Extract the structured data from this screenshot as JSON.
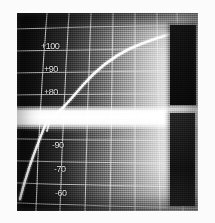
{
  "figure": {
    "kind": "oscillogram",
    "plate_background": "#0a0a0a",
    "trace_color": "#ffffff",
    "grid_color": "#e8e8e8",
    "page_background": "#fbfbfb"
  },
  "chart_data": {
    "type": "line",
    "title": "",
    "subtitle": "",
    "xlabel": "",
    "ylabel": "",
    "grid": true,
    "grid_style": "curvilinear graticule",
    "legend": "none",
    "ylim": [
      -100,
      110
    ],
    "xlim": [
      0,
      100
    ],
    "ytick_labels": [
      "+100",
      "+90",
      "+80",
      "-90",
      "-70",
      "-60",
      "-80"
    ],
    "ytick_values": [
      100,
      90,
      80,
      -90,
      -70,
      -60,
      -80
    ],
    "xtick_labels": [],
    "annotations": [],
    "series": [
      {
        "name": "upper-trace",
        "x": [
          20,
          24,
          28,
          33,
          38,
          45,
          52,
          60,
          68,
          76,
          84,
          90,
          95,
          100
        ],
        "y": [
          8,
          18,
          30,
          41,
          50,
          58,
          64,
          70,
          76,
          82,
          88,
          93,
          97,
          99
        ]
      },
      {
        "name": "baseline-band",
        "x": [
          0,
          100
        ],
        "y": [
          0,
          0
        ]
      },
      {
        "name": "lower-trace",
        "x": [
          1,
          2,
          3,
          4,
          6,
          8,
          11,
          14,
          17,
          19
        ],
        "y": [
          -6,
          -20,
          -36,
          -50,
          -64,
          -76,
          -86,
          -93,
          -97,
          -100
        ]
      }
    ]
  },
  "axis_labels": [
    {
      "text": "+100",
      "top": 28,
      "left": 24
    },
    {
      "text": "+90",
      "top": 51,
      "left": 27
    },
    {
      "text": "+80",
      "top": 74,
      "left": 27
    },
    {
      "text": "-90",
      "top": 127,
      "left": 35
    },
    {
      "text": "-70",
      "top": 151,
      "left": 37
    },
    {
      "text": "-60",
      "top": 175,
      "left": 38
    },
    {
      "text": "-80",
      "top": 197,
      "left": 40
    }
  ],
  "blocks": [
    {
      "name": "marker-block-upper",
      "color": "#101010"
    },
    {
      "name": "marker-block-lower",
      "color": "#1c1c1c"
    }
  ]
}
